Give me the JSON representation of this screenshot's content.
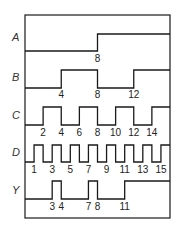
{
  "diagram": {
    "type": "timing-diagram",
    "time_units": 16,
    "frame": {
      "left": 25,
      "top": 15,
      "right": 170,
      "bottom": 218
    },
    "signals": [
      {
        "name": "A",
        "label_y": 41,
        "high_y": 34,
        "low_y": 51,
        "tick_y": 62,
        "initial": 0,
        "transitions": [
          8
        ],
        "tick_labels": [
          "8"
        ],
        "tick_times": [
          8
        ]
      },
      {
        "name": "B",
        "label_y": 81,
        "high_y": 70,
        "low_y": 88,
        "tick_y": 98,
        "initial": 0,
        "transitions": [
          4,
          8,
          12
        ],
        "tick_labels": [
          "4",
          "8",
          "12"
        ],
        "tick_times": [
          4,
          8,
          12
        ]
      },
      {
        "name": "C",
        "label_y": 119,
        "high_y": 107,
        "low_y": 125,
        "tick_y": 136,
        "initial": 0,
        "transitions": [
          2,
          4,
          6,
          8,
          10,
          12,
          14
        ],
        "tick_labels": [
          "2",
          "4",
          "6",
          "8",
          "10",
          "12",
          "14"
        ],
        "tick_times": [
          2,
          4,
          6,
          8,
          10,
          12,
          14
        ]
      },
      {
        "name": "D",
        "label_y": 156,
        "high_y": 145,
        "low_y": 162,
        "tick_y": 173,
        "initial": 0,
        "transitions": [
          1,
          2,
          3,
          4,
          5,
          6,
          7,
          8,
          9,
          10,
          11,
          12,
          13,
          14,
          15,
          16
        ],
        "tick_labels": [
          "1",
          "3",
          "5",
          "7",
          "9",
          "11",
          "13",
          "15"
        ],
        "tick_times": [
          1,
          3,
          5,
          7,
          9,
          11,
          13,
          15
        ]
      },
      {
        "name": "Y",
        "label_y": 194,
        "high_y": 181,
        "low_y": 199,
        "tick_y": 210,
        "initial": 0,
        "transitions": [
          3,
          4,
          7,
          8,
          11
        ],
        "tick_labels": [
          "3",
          "4",
          "7",
          "8",
          "11"
        ],
        "tick_times": [
          3,
          4,
          7,
          8,
          11
        ]
      }
    ]
  }
}
